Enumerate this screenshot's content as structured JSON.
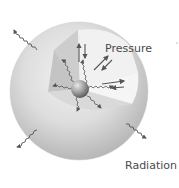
{
  "diagram": {
    "labels": {
      "pressure": "Pressure",
      "radiation": "Radiation"
    },
    "components": {
      "star": "outer-sphere",
      "cutaway": "interior-wedge",
      "core": "central-core-ball",
      "pressure_arrows": "paired-opposing-arrows",
      "radiation_waves": "wavy-photon-arrows"
    },
    "colors": {
      "background": "#ffffff",
      "sphere_light": "#e6e6e6",
      "sphere_dark": "#b9b9b9",
      "wedge_face_left": "#c9c9c9",
      "wedge_face_right": "#eeeeee",
      "wedge_floor": "#d8d8d8",
      "arrows": "#555555",
      "text": "#4a4a4a"
    }
  }
}
